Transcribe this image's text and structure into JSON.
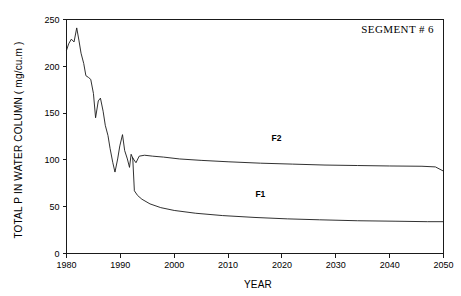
{
  "chart_data": {
    "type": "line",
    "title": "",
    "annotation": "SEGMENT # 6",
    "xlabel": "YEAR",
    "ylabel": "TOTAL P IN WATER COLUMN  ( mg/cu.m )",
    "xlim": [
      1980,
      2050
    ],
    "ylim": [
      0,
      250
    ],
    "xticks": [
      1980,
      1990,
      2000,
      2010,
      2020,
      2030,
      2040,
      2050
    ],
    "xticklabels": [
      "1980",
      "1990",
      "2000",
      "2010",
      "2020",
      "2030",
      "2040",
      "2050"
    ],
    "yticks": [
      0,
      50,
      100,
      150,
      200,
      250
    ],
    "yticklabels": [
      "0",
      "50",
      "100",
      "150",
      "200",
      "250"
    ],
    "grid": false,
    "legend_position": "inline-labels",
    "series": [
      {
        "name": "historical",
        "label": "",
        "x": [
          1980.0,
          1980.4,
          1980.9,
          1981.4,
          1981.9,
          1982.3,
          1982.7,
          1983.2,
          1983.6,
          1984.1,
          1984.5,
          1985.0,
          1985.4,
          1985.9,
          1986.3,
          1986.8,
          1987.2,
          1987.7,
          1988.1,
          1988.6,
          1989.0,
          1989.5,
          1989.9,
          1990.4,
          1990.8,
          1991.3,
          1991.7,
          1992.0,
          1992.3
        ],
        "y": [
          217,
          224,
          229,
          226,
          241,
          228,
          214,
          203,
          190,
          188,
          186,
          171,
          145,
          163,
          166,
          152,
          137,
          126,
          112,
          97,
          87,
          101,
          115,
          127,
          110,
          101,
          92,
          106,
          102
        ]
      },
      {
        "name": "F2",
        "label": "F2",
        "x": [
          1992.3,
          1992.9,
          1993.5,
          1994.5,
          1996.0,
          1998.0,
          2001.0,
          2005.0,
          2010.0,
          2016.0,
          2022.0,
          2028.0,
          2034.0,
          2040.0,
          2046.0,
          2048.5,
          2050.0
        ],
        "y": [
          102,
          97,
          104,
          105,
          104,
          103,
          101,
          99.5,
          98,
          96.5,
          95.5,
          94.5,
          94,
          93.5,
          93.2,
          92.5,
          88
        ]
      },
      {
        "name": "F1",
        "label": "F1",
        "x": [
          1992.3,
          1992.6,
          1993.2,
          1994.0,
          1995.5,
          1997.5,
          2000.0,
          2004.0,
          2009.0,
          2015.0,
          2021.0,
          2027.0,
          2034.0,
          2041.0,
          2047.0,
          2050.0
        ],
        "y": [
          102,
          67,
          62,
          58,
          53,
          49,
          46,
          43,
          40.5,
          38.5,
          37,
          36,
          35,
          34.5,
          34,
          34
        ]
      }
    ],
    "series_label_positions": [
      {
        "name": "F2",
        "x": 2019,
        "y": 120
      },
      {
        "name": "F1",
        "x": 2016,
        "y": 60
      }
    ],
    "colors": {
      "line": "#1a1a1a",
      "axis": "#1a1a1a",
      "background": "#ffffff"
    }
  }
}
